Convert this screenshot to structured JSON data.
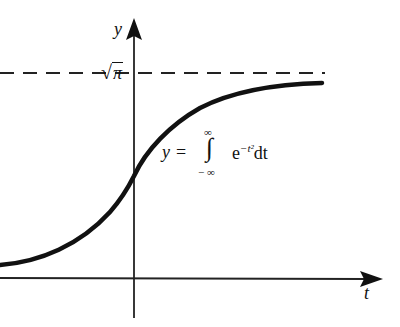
{
  "diagram": {
    "type": "function-graph",
    "axes": {
      "x_label": "t",
      "y_label": "y"
    },
    "asymptote": {
      "label": "√π",
      "radical": "√",
      "radicand": "π",
      "style": "dashed"
    },
    "formula": {
      "lhs": "y",
      "equals": "=",
      "integral_symbol": "∫",
      "upper_limit": "∞",
      "lower_limit": "− ∞",
      "integrand_base": "e",
      "integrand_exponent": "−t²",
      "differential": "dt"
    },
    "colors": {
      "ink": "#111111",
      "background": "#ffffff"
    }
  }
}
